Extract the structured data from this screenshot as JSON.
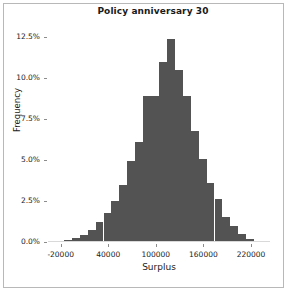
{
  "window": {
    "background_color": "#ffffff",
    "frame_color": "#b8b8b8"
  },
  "chart_data": {
    "type": "bar",
    "subtype": "histogram",
    "title": "Policy anniversary 30",
    "xlabel": "Surplus",
    "ylabel": "Frequency",
    "bar_color": "#535353",
    "grid": false,
    "legend": null,
    "xlim": [
      -36000,
      244000
    ],
    "ylim": [
      0,
      0.134
    ],
    "xtick_labels": [
      "-20000",
      "40000",
      "100000",
      "160000",
      "220000"
    ],
    "xtick_values": [
      -20000,
      40000,
      100000,
      160000,
      220000
    ],
    "ytick_labels": [
      "0.0%",
      "2.5%",
      "5.0%",
      "7.5%",
      "10.0%",
      "12.5%"
    ],
    "ytick_values": [
      0.0,
      2.5,
      5.0,
      7.5,
      10.0,
      12.5
    ],
    "bin_width": 10000,
    "bins": [
      {
        "left": -16000,
        "right": -6000,
        "center": -11000,
        "value": 0.1
      },
      {
        "left": -6000,
        "right": 4000,
        "center": -1000,
        "value": 0.25
      },
      {
        "left": 4000,
        "right": 14000,
        "center": 9000,
        "value": 0.45
      },
      {
        "left": 14000,
        "right": 24000,
        "center": 19000,
        "value": 0.75
      },
      {
        "left": 24000,
        "right": 34000,
        "center": 29000,
        "value": 1.2
      },
      {
        "left": 34000,
        "right": 44000,
        "center": 39000,
        "value": 1.75
      },
      {
        "left": 44000,
        "right": 54000,
        "center": 49000,
        "value": 2.5
      },
      {
        "left": 54000,
        "right": 64000,
        "center": 59000,
        "value": 3.45
      },
      {
        "left": 64000,
        "right": 74000,
        "center": 69000,
        "value": 4.95
      },
      {
        "left": 74000,
        "right": 84000,
        "center": 79000,
        "value": 6.1
      },
      {
        "left": 84000,
        "right": 94000,
        "center": 89000,
        "value": 8.9
      },
      {
        "left": 94000,
        "right": 104000,
        "center": 99000,
        "value": 8.9
      },
      {
        "left": 104000,
        "right": 114000,
        "center": 109000,
        "value": 10.95
      },
      {
        "left": 114000,
        "right": 124000,
        "center": 119000,
        "value": 12.35
      },
      {
        "left": 124000,
        "right": 134000,
        "center": 129000,
        "value": 10.45
      },
      {
        "left": 134000,
        "right": 144000,
        "center": 139000,
        "value": 8.9
      },
      {
        "left": 144000,
        "right": 154000,
        "center": 149000,
        "value": 6.75
      },
      {
        "left": 154000,
        "right": 164000,
        "center": 159000,
        "value": 5.05
      },
      {
        "left": 164000,
        "right": 174000,
        "center": 169000,
        "value": 3.6
      },
      {
        "left": 174000,
        "right": 184000,
        "center": 179000,
        "value": 2.65
      },
      {
        "left": 184000,
        "right": 194000,
        "center": 189000,
        "value": 1.55
      },
      {
        "left": 194000,
        "right": 204000,
        "center": 199000,
        "value": 0.95
      },
      {
        "left": 204000,
        "right": 214000,
        "center": 209000,
        "value": 0.5
      },
      {
        "left": 214000,
        "right": 224000,
        "center": 219000,
        "value": 0.2
      }
    ]
  }
}
